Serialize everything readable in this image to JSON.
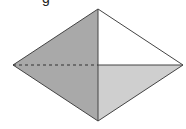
{
  "caption_fragment": "g",
  "figure": {
    "shape": "rhombus-pyramid-view",
    "vertices": {
      "top": [
        98,
        9
      ],
      "left": [
        13,
        65
      ],
      "right": [
        183,
        65
      ],
      "bottom": [
        98,
        121
      ],
      "center": [
        98,
        65
      ]
    },
    "faces": [
      {
        "name": "upper-left",
        "fill": "#a9a9a9"
      },
      {
        "name": "lower-left",
        "fill": "#a9a9a9"
      },
      {
        "name": "upper-right",
        "fill": "#ffffff"
      },
      {
        "name": "lower-right",
        "fill": "#cfcfcf"
      }
    ],
    "edge_color": "#333333",
    "hidden_edge": "left-to-center dashed"
  }
}
